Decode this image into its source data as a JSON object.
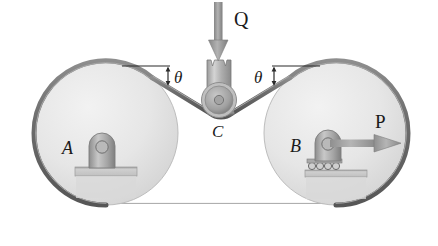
{
  "figure": {
    "name": "belt-pulley-system",
    "background_color": "#ffffff"
  },
  "colors": {
    "belt": "#6e6e6e",
    "belt_highlight": "#a8a8a8",
    "pulley_fill_light": "#ededed",
    "pulley_fill_dark": "#cfcfcf",
    "pulley_rim": "#8a8a8a",
    "pulley_rim_dark": "#6a6a6a",
    "support_fill": "#b4b4b4",
    "support_dark": "#8c8c8c",
    "arrow": "#9a9a9a",
    "arrow_dark": "#7a7a7a",
    "label": "#1a1a1a",
    "leader_line": "#2b2b2b"
  },
  "labels": {
    "pulley_a": "A",
    "pulley_b": "B",
    "idler_c": "C",
    "force_q": "Q",
    "force_p": "P",
    "theta_left": "θ",
    "theta_right": "θ"
  },
  "elements": {
    "pulley_a": {
      "name": "pulley-a",
      "center_x": 106,
      "center_y": 133,
      "radius": 72,
      "support_type": "pin"
    },
    "pulley_b": {
      "name": "pulley-b",
      "center_x": 336,
      "center_y": 133,
      "radius": 72,
      "support_type": "roller"
    },
    "idler_c": {
      "name": "idler-pulley-c",
      "center_x": 219,
      "center_y": 100,
      "radius": 16,
      "support_type": "yoke"
    },
    "force_q": {
      "name": "force-q",
      "direction": "down",
      "tip_x": 219,
      "tip_y": 62
    },
    "force_p": {
      "name": "force-p",
      "direction": "right",
      "tip_x": 400,
      "tip_y": 143
    },
    "belt": {
      "name": "belt",
      "segments": [
        "top-left-span",
        "top-right-span",
        "bottom-span",
        "wrap-a",
        "wrap-b",
        "wrap-c"
      ]
    }
  },
  "annotations": {
    "theta_left": {
      "name": "angle-theta-left",
      "reference_line": "horizontal",
      "measured_between": "horizontal reference and belt segment"
    },
    "theta_right": {
      "name": "angle-theta-right",
      "reference_line": "horizontal",
      "measured_between": "horizontal reference and belt segment"
    }
  }
}
